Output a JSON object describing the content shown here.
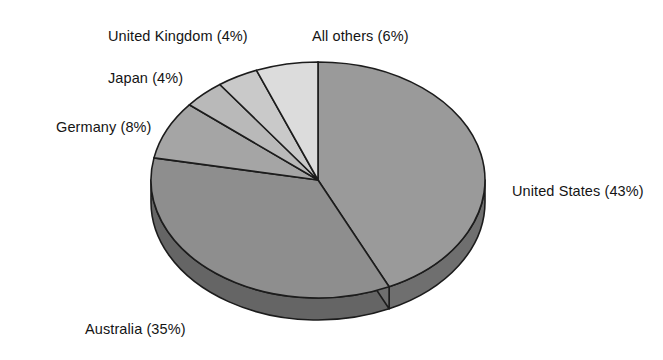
{
  "chart_data": {
    "type": "pie",
    "title": "",
    "subtitle": "",
    "xlabel": "",
    "ylabel": "",
    "legend_position": "none",
    "grid": false,
    "style": "3d-pie",
    "start_angle_deg": 0,
    "direction": "clockwise",
    "categories": [
      "United States",
      "Australia",
      "Germany",
      "Japan",
      "United Kingdom",
      "All others"
    ],
    "values": [
      43,
      35,
      8,
      4,
      4,
      6
    ],
    "units": "percent",
    "slices": [
      {
        "name": "United States",
        "label": "United States (43%)",
        "value": 43,
        "color": "#9a9a9a",
        "side_color": "#6f6f6f",
        "start_deg": 0,
        "end_deg": 154.8,
        "label_x": 512,
        "label_y": 183
      },
      {
        "name": "Australia",
        "label": "Australia (35%)",
        "value": 35,
        "color": "#8e8e8e",
        "side_color": "#656565",
        "start_deg": 154.8,
        "end_deg": 280.8,
        "label_x": 85,
        "label_y": 321
      },
      {
        "name": "Germany",
        "label": "Germany (8%)",
        "value": 8,
        "color": "#a5a5a5",
        "side_color": "#787878",
        "start_deg": 280.8,
        "end_deg": 309.6,
        "label_x": 56,
        "label_y": 119
      },
      {
        "name": "Japan",
        "label": "Japan (4%)",
        "value": 4,
        "color": "#b9b9b9",
        "side_color": "#8a8a8a",
        "start_deg": 309.6,
        "end_deg": 324.0,
        "label_x": 108,
        "label_y": 70
      },
      {
        "name": "United Kingdom",
        "label": "United Kingdom (4%)",
        "value": 4,
        "color": "#c9c9c9",
        "side_color": "#999999",
        "start_deg": 324.0,
        "end_deg": 338.4,
        "label_x": 108,
        "label_y": 28
      },
      {
        "name": "All others",
        "label": "All others (6%)",
        "value": 6,
        "color": "#dcdcdc",
        "side_color": "#a9a9a9",
        "start_deg": 338.4,
        "end_deg": 360.0,
        "label_x": 312,
        "label_y": 28
      }
    ],
    "geometry": {
      "center_x": 318,
      "center_y": 180,
      "radius_x": 167,
      "radius_y": 118,
      "depth": 22
    },
    "colors": {
      "outline": "#1c1c1c",
      "background": "#ffffff",
      "text": "#141414"
    }
  }
}
